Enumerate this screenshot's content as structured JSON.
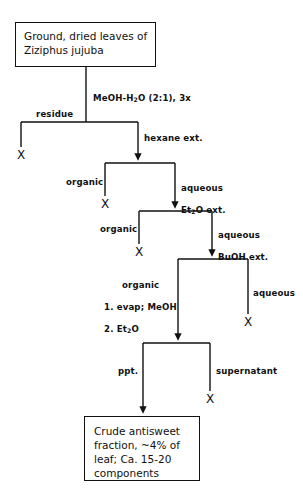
{
  "diagram": {
    "nodes": {
      "start": {
        "label": "Ground, dried leaves of\nZiziphus jujuba",
        "line1": "Ground, dried  leaves of",
        "line2": "Ziziphus  jujuba"
      },
      "product": {
        "label": "Crude antisweet fraction, ~4% of leaf; Ca. 15-20 components",
        "line1": "Crude antisweet",
        "line2": "fraction, ~4% of",
        "line3": "leaf; Ca. 15-20",
        "line4": "components"
      }
    },
    "edge_labels": {
      "extraction_solvent_pre": "MeOH-H",
      "extraction_solvent_sub": "2",
      "extraction_solvent_post": "O  (2:1), 3x",
      "extraction_solvent_full": "MeOH-H2O (2:1), 3x",
      "residue": "residue",
      "hexane_ext": "hexane ext.",
      "organic_1": "organic",
      "aqueous_et2o_line1": "aqueous",
      "aqueous_et2o_line2_pre": "Et",
      "aqueous_et2o_line2_sub": "2",
      "aqueous_et2o_line2_post": "O ext.",
      "aqueous_et2o_full": "aqueous Et2O ext.",
      "organic_2": "organic",
      "aqueous_buoh_line1": "aqueous",
      "aqueous_buoh_line2": "BuOH ext.",
      "organic_3_line1": "organic",
      "organic_3_line2": "1. evap; MeOH",
      "organic_3_line3_pre": "2. Et",
      "organic_3_line3_sub": "2",
      "organic_3_line3_post": "O",
      "organic_3_full": "organic 1. evap; MeOH 2. Et2O",
      "aqueous_3": "aqueous",
      "ppt": "ppt.",
      "supernatant": "supernatant"
    },
    "terminals": {
      "x1": "X",
      "x2": "X",
      "x3": "X",
      "x4": "X",
      "x5": "X"
    },
    "colors": {
      "stroke": "#111111",
      "background": "#ffffff",
      "text": "#111111"
    }
  }
}
